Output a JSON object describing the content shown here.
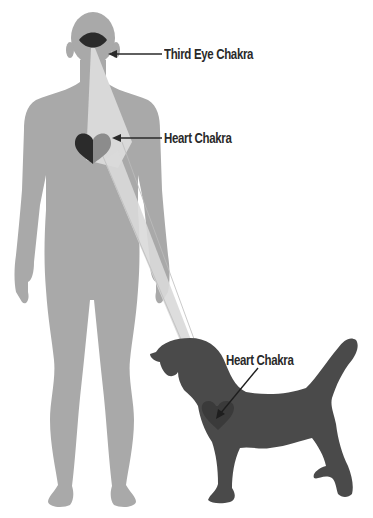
{
  "diagram": {
    "title": "",
    "labels": {
      "third_eye": "Third Eye Chakra",
      "human_heart": "Heart Chakra",
      "dog_heart": "Heart Chakra"
    },
    "figures": [
      "human-silhouette",
      "dog-silhouette"
    ],
    "connections": [
      {
        "from": "third-eye-chakra",
        "to": "human-heart-chakra",
        "type": "light-beam"
      },
      {
        "from": "human-heart-chakra",
        "to": "dog-heart-chakra",
        "type": "light-beam"
      }
    ],
    "colors": {
      "human": "#a9a9a9",
      "dog": "#4a4a4a",
      "beam": "#d9d9d9",
      "chakra_dark": "#2b2b2b",
      "chakra_mid": "#8c8c8c",
      "text": "#2a2a2a"
    }
  }
}
